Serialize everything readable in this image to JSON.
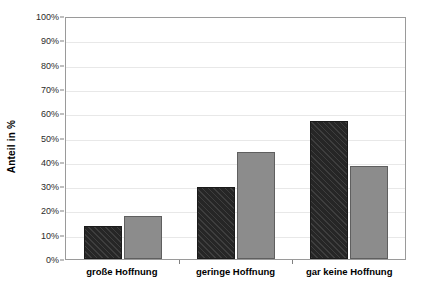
{
  "chart_data": {
    "type": "bar",
    "title": "",
    "subtitle": "",
    "xlabel": "",
    "ylabel": "Anteil in %",
    "ylim": [
      0,
      100
    ],
    "grid": true,
    "legend": "none",
    "categories": [
      "große Hoffnung",
      "geringe Hoffnung",
      "gar keine Hoffnung"
    ],
    "y_ticks": [
      "0%",
      "10%",
      "20%",
      "30%",
      "40%",
      "50%",
      "60%",
      "70%",
      "80%",
      "90%",
      "100%"
    ],
    "y_tick_values": [
      0,
      10,
      20,
      30,
      40,
      50,
      60,
      70,
      80,
      90,
      100
    ],
    "series": [
      {
        "name": "series-dark",
        "color": "#262626",
        "pattern": "diagonal-hatch",
        "values": [
          13.6,
          17.7,
          29.6
        ],
        "labels": [
          "13,6%",
          "29,6%",
          "56,8%"
        ]
      },
      {
        "name": "series-light",
        "color": "#8c8c8c",
        "pattern": "solid",
        "values": [
          17.7,
          44.2,
          38.1
        ],
        "labels": [
          "17,7%",
          "44,2%",
          "38,1%"
        ]
      }
    ],
    "groups": [
      {
        "category": "große Hoffnung",
        "bars": [
          {
            "series": "series-dark",
            "value": 13.6,
            "label": "13,6%"
          },
          {
            "series": "series-light",
            "value": 17.7,
            "label": "17,7%"
          }
        ]
      },
      {
        "category": "geringe Hoffnung",
        "bars": [
          {
            "series": "series-dark",
            "value": 29.6,
            "label": "29,6%"
          },
          {
            "series": "series-light",
            "value": 44.2,
            "label": "44,2%"
          }
        ]
      },
      {
        "category": "gar keine Hoffnung",
        "bars": [
          {
            "series": "series-dark",
            "value": 56.8,
            "label": "56,8%"
          },
          {
            "series": "series-light",
            "value": 38.1,
            "label": "38,1%"
          }
        ]
      }
    ]
  },
  "colors": {
    "series_dark": "#262626",
    "series_light": "#8c8c8c",
    "gridline": "#e8e8e8",
    "axis": "#9a9a9a",
    "background": "#ffffff",
    "text": "#000000"
  }
}
